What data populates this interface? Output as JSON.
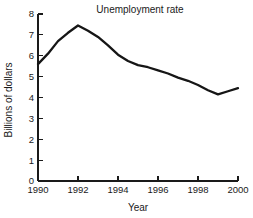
{
  "chart_data": {
    "type": "line",
    "title": "Unemployment rate",
    "xlabel": "Year",
    "ylabel": "Billions of dollars",
    "xlim": [
      1990,
      2000
    ],
    "ylim": [
      0,
      8
    ],
    "grid": false,
    "legend": null,
    "x_ticks": [
      "1990",
      "1992",
      "1994",
      "1996",
      "1998",
      "2000"
    ],
    "x_tick_values": [
      1990,
      1992,
      1994,
      1996,
      1998,
      2000
    ],
    "y_ticks": [
      "0",
      "1",
      "2",
      "3",
      "4",
      "5",
      "6",
      "7",
      "8"
    ],
    "y_tick_values": [
      0,
      1,
      2,
      3,
      4,
      5,
      6,
      7,
      8
    ],
    "x": [
      1990,
      1990.5,
      1991,
      1991.5,
      1992,
      1992.5,
      1993,
      1993.5,
      1994,
      1994.5,
      1995,
      1995.5,
      1996,
      1996.5,
      1997,
      1997.5,
      1998,
      1998.5,
      1999,
      1999.5,
      2000
    ],
    "values": [
      5.6,
      6.1,
      6.7,
      7.1,
      7.45,
      7.2,
      6.9,
      6.5,
      6.05,
      5.75,
      5.55,
      5.45,
      5.3,
      5.15,
      4.95,
      4.8,
      4.6,
      4.35,
      4.15,
      4.3,
      4.45
    ],
    "series": [
      {
        "name": "Unemployment rate",
        "color": "#161616",
        "values": [
          5.6,
          6.1,
          6.7,
          7.1,
          7.45,
          7.2,
          6.9,
          6.5,
          6.05,
          5.75,
          5.55,
          5.45,
          5.3,
          5.15,
          4.95,
          4.8,
          4.6,
          4.35,
          4.15,
          4.3,
          4.45
        ]
      }
    ]
  },
  "plot": {
    "left_px": 38,
    "right_px": 238,
    "top_px": 14,
    "bottom_px": 181,
    "tick_len_px": 5,
    "title_x_px": 140,
    "title_y_px": 13,
    "xlabel_x_px": 138,
    "xlabel_y_px": 211,
    "ylabel_x_px": 12,
    "ylabel_y_px": 100
  }
}
